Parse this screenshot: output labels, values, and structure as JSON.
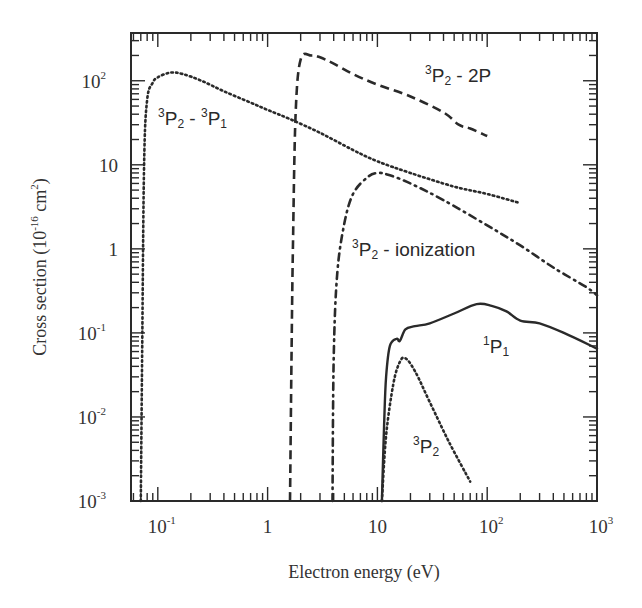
{
  "chart_data": {
    "type": "line",
    "title": "",
    "xlabel": "Electron energy  (eV)",
    "ylabel": "Cross section  (10^-16 cm^2)",
    "xscale": "log",
    "yscale": "log",
    "xlim": [
      0.057,
      1000
    ],
    "ylim": [
      0.001,
      370
    ],
    "grid": false,
    "legend": "none (curves labeled inline)",
    "x_ticks": [
      {
        "value": 0.1,
        "base": "10",
        "exp": "-1"
      },
      {
        "value": 1,
        "base": "1",
        "exp": ""
      },
      {
        "value": 10,
        "base": "10",
        "exp": ""
      },
      {
        "value": 100,
        "base": "10",
        "exp": "2"
      },
      {
        "value": 1000,
        "base": "10",
        "exp": "3"
      }
    ],
    "y_ticks": [
      {
        "value": 0.001,
        "base": "10",
        "exp": "-3"
      },
      {
        "value": 0.01,
        "base": "10",
        "exp": "-2"
      },
      {
        "value": 0.1,
        "base": "10",
        "exp": "-1"
      },
      {
        "value": 1,
        "base": "1",
        "exp": ""
      },
      {
        "value": 10,
        "base": "10",
        "exp": ""
      },
      {
        "value": 100,
        "base": "10",
        "exp": "2"
      }
    ],
    "series": [
      {
        "name": "3P2 - 3P1",
        "label": {
          "pre": "3",
          "main": "P",
          "sub": "2",
          "mid": " - ",
          "pre2": "3",
          "main2": "P",
          "sub2": "1"
        },
        "style": "dotted",
        "x": [
          0.07,
          0.072,
          0.075,
          0.08,
          0.09,
          0.1,
          0.13,
          0.17,
          0.25,
          0.4,
          0.7,
          1.0,
          1.6,
          3,
          6,
          10,
          20,
          50,
          100,
          200
        ],
        "y": [
          0.001,
          0.05,
          10,
          60,
          95,
          110,
          125,
          120,
          100,
          75,
          55,
          45,
          35,
          24,
          15,
          11,
          8,
          5.5,
          4.5,
          3.5
        ]
      },
      {
        "name": "3P2 - 2P",
        "label": {
          "pre": "3",
          "main": "P",
          "sub": "2",
          "mid": " - 2P"
        },
        "style": "dashed",
        "x": [
          1.6,
          1.65,
          1.7,
          1.8,
          2.0,
          2.5,
          3.0,
          4,
          6,
          10,
          20,
          40,
          55,
          70,
          100
        ],
        "y": [
          0.001,
          0.05,
          1,
          40,
          180,
          200,
          190,
          160,
          120,
          90,
          65,
          42,
          30,
          27,
          22
        ]
      },
      {
        "name": "3P2 - ionization",
        "label": {
          "pre": "3",
          "main": "P",
          "sub": "2",
          "mid": " - ionization"
        },
        "style": "dashdot",
        "x": [
          3.9,
          4.0,
          4.3,
          5,
          6,
          8,
          10,
          13,
          20,
          40,
          100,
          200,
          400,
          800,
          1000
        ],
        "y": [
          0.001,
          0.05,
          0.5,
          2.0,
          4.5,
          7,
          8,
          7.5,
          6,
          3.8,
          1.9,
          1.1,
          0.6,
          0.35,
          0.28
        ]
      },
      {
        "name": "1P1",
        "label": {
          "pre": "1",
          "main": "P",
          "sub": "1",
          "mid": ""
        },
        "style": "solid",
        "x": [
          11,
          11.5,
          12,
          13,
          15,
          16,
          18,
          22,
          30,
          50,
          80,
          110,
          150,
          200,
          300,
          500,
          1000
        ],
        "y": [
          0.001,
          0.008,
          0.03,
          0.07,
          0.085,
          0.08,
          0.11,
          0.12,
          0.13,
          0.17,
          0.22,
          0.21,
          0.18,
          0.14,
          0.13,
          0.1,
          0.065
        ]
      },
      {
        "name": "3P2",
        "label": {
          "pre": "3",
          "main": "P",
          "sub": "2",
          "mid": ""
        },
        "style": "dotted",
        "x": [
          11,
          12,
          14,
          16,
          18,
          22,
          30,
          45,
          70
        ],
        "y": [
          0.001,
          0.006,
          0.025,
          0.045,
          0.05,
          0.035,
          0.015,
          0.005,
          0.0017
        ]
      }
    ],
    "annotations": [
      {
        "text": "3P2 - 3P1",
        "x_px": 158,
        "y_px": 125
      },
      {
        "text": "3P2 - 2P",
        "x_px": 425,
        "y_px": 82
      },
      {
        "text": "3P2 - ionization",
        "x_px": 352,
        "y_px": 256
      },
      {
        "text": "1P1",
        "x_px": 483,
        "y_px": 353
      },
      {
        "text": "3P2",
        "x_px": 413,
        "y_px": 453
      }
    ]
  },
  "axes": {
    "xlabel": "Electron energy  (eV)",
    "ylabel_main": "Cross section  (10",
    "ylabel_exp": "-16",
    "ylabel_unit": " cm",
    "ylabel_unit_exp": "2",
    "ylabel_close": ")"
  },
  "colors": {
    "ink": "#2a2a2a",
    "background": "#ffffff"
  }
}
